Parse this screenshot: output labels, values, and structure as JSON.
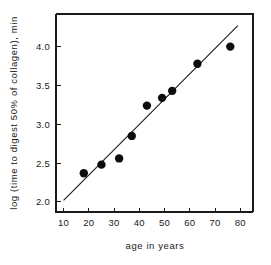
{
  "chart_data": {
    "type": "scatter",
    "title": "",
    "subtitle": "",
    "xlabel": "age in years",
    "ylabel": "log (time to digest 50% of collagen), min",
    "xlim": [
      7,
      85
    ],
    "ylim": [
      1.87,
      4.42
    ],
    "xticks": [
      10,
      20,
      30,
      40,
      50,
      60,
      70,
      80
    ],
    "xtick_labels": [
      "10",
      "20",
      "30",
      "40",
      "50",
      "60",
      "70",
      "80"
    ],
    "yticks": [
      2.0,
      2.5,
      3.0,
      3.5,
      4.0
    ],
    "ytick_labels": [
      "2.0",
      "2.5",
      "3.0",
      "3.5",
      "4.0"
    ],
    "grid": false,
    "legend": null,
    "legend_position": "none",
    "marker": "filled-circle",
    "marker_color": "#0d0d0d",
    "line_color": "#1a1a1a",
    "series": [
      {
        "name": "collagen digestion time vs age",
        "x": [
          18,
          25,
          32,
          37,
          43,
          49,
          53,
          63,
          76
        ],
        "y": [
          2.37,
          2.48,
          2.56,
          2.85,
          3.24,
          3.34,
          3.43,
          3.78,
          4.0
        ]
      }
    ],
    "fit_line": {
      "name": "least-squares fit",
      "x": [
        10,
        79
      ],
      "y": [
        2.02,
        4.27
      ]
    },
    "annotations": []
  },
  "figure": {
    "background_color": "#ffffff",
    "axis_color": "#1a1a1a"
  }
}
